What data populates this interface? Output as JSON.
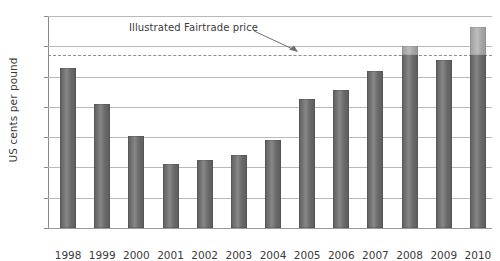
{
  "chart_data": {
    "type": "bar",
    "title": "",
    "xlabel": "",
    "ylabel": "US cents per pound",
    "ylim": [
      0,
      140
    ],
    "ytick_step": 20,
    "yticks": [
      140,
      120,
      100,
      80,
      60,
      40,
      20,
      0
    ],
    "grid": true,
    "legend": false,
    "categories": [
      "1998",
      "1999",
      "2000",
      "2001",
      "2002",
      "2003",
      "2004",
      "2005",
      "2006",
      "2007",
      "2008",
      "2009",
      "2010"
    ],
    "values": [
      106,
      82,
      61,
      42,
      45,
      48,
      58,
      85,
      91,
      104,
      120,
      111,
      133
    ],
    "series": [
      {
        "name": "World market price",
        "values": [
          106,
          82,
          61,
          42,
          45,
          48,
          58,
          85,
          91,
          104,
          120,
          111,
          133
        ]
      }
    ],
    "reference_line": {
      "label": "Illustrated Fairtrade price",
      "value": 114,
      "style": "dashed",
      "color": "#8e8e8e"
    },
    "annotations": [
      {
        "text": "Illustrated Fairtrade price",
        "points_to_value": 114,
        "arrow": "down-right"
      }
    ],
    "colors": {
      "bar": "#6e6e6e",
      "bar_above_fairtrade": "#aaaaaa",
      "gridline": "#b9b9b9",
      "axis": "#8a8a8a",
      "text": "#3a3a3a",
      "background": "#ffffff"
    }
  }
}
